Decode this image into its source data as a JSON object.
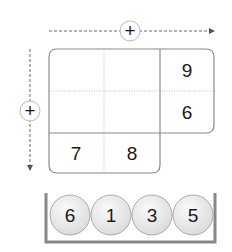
{
  "puzzle": {
    "grid": {
      "top_row_right": "9",
      "middle_row_right": "6",
      "bottom_row_left": "7",
      "bottom_row_middle": "8"
    },
    "operators": {
      "horizontal": "+",
      "vertical": "+"
    },
    "balls": [
      "6",
      "1",
      "3",
      "5"
    ]
  },
  "colors": {
    "border": "#8a8a8a",
    "ball_fill": "#ececec",
    "tray": "#888888"
  }
}
